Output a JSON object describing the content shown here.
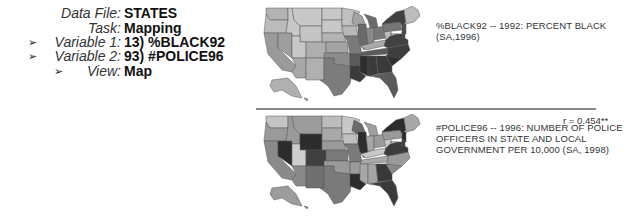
{
  "info_panel": {
    "rows": [
      {
        "label": "Data File:",
        "value": "STATES",
        "arrow": false
      },
      {
        "label": "Task:",
        "value": "Mapping",
        "arrow": false
      },
      {
        "label": "Variable 1:",
        "value": "13) %BLACK92",
        "arrow": true
      },
      {
        "label": "Variable 2:",
        "value": "93) #POLICE96",
        "arrow": true
      },
      {
        "label": "View:",
        "value": "Map",
        "arrow": true
      }
    ],
    "arrow_glyph": "➢"
  },
  "maps": [
    {
      "variable": "%BLACK92",
      "caption_lines": [
        "%BLACK92 -- 1992: PERCENT BLACK",
        "(SA,1996)"
      ],
      "shading": {
        "WA": "#b4b4b4",
        "OR": "#bcbcbc",
        "CA": "#9a9a9a",
        "NV": "#9e9e9e",
        "ID": "#c8c8c8",
        "MT": "#c8c8c8",
        "WY": "#c4c4c4",
        "UT": "#c8c8c8",
        "AZ": "#a8a8a8",
        "CO": "#aeaeae",
        "NM": "#b0b0b0",
        "ND": "#c8c8c8",
        "SD": "#c8c8c8",
        "NE": "#b4b4b4",
        "KS": "#a4a4a4",
        "OK": "#8c8c8c",
        "TX": "#7c7c7c",
        "MN": "#c0c0c0",
        "IA": "#b8b8b8",
        "MO": "#7a7a7a",
        "AR": "#5a5a5a",
        "LA": "#3a3a3a",
        "WI": "#a4a4a4",
        "IL": "#6a6a6a",
        "MI": "#6a6a6a",
        "IN": "#8a8a8a",
        "OH": "#787878",
        "KY": "#a8a8a8",
        "TN": "#5c5c5c",
        "MS": "#2e2e2e",
        "AL": "#3a3a3a",
        "GA": "#3a3a3a",
        "FL": "#5a5a5a",
        "SC": "#303030",
        "NC": "#3e3e3e",
        "VA": "#424242",
        "WV": "#bcbcbc",
        "PA": "#767676",
        "NY": "#404040",
        "NJ": "#505050",
        "DE": "#4a4a4a",
        "MD": "#343434",
        "NE_NEW": "#bdbdbd",
        "AK": "#b0b0b0",
        "HI": "#9a9a9a"
      }
    },
    {
      "variable": "#POLICE96",
      "caption_lines": [
        "#POLICE96 -- 1996: NUMBER OF POLICE",
        "OFFICERS IN STATE AND LOCAL",
        "GOVERNMENT PER 10,000 (SA, 1998)"
      ],
      "correlation": "r = 0.454**",
      "shading": {
        "WA": "#c4c4c4",
        "OR": "#9a9a9a",
        "CA": "#8a8a8a",
        "NV": "#2c2c2c",
        "ID": "#9a9a9a",
        "MT": "#9c9c9c",
        "WY": "#2c2c2c",
        "UT": "#cdcdcd",
        "AZ": "#8a8a8a",
        "CO": "#404040",
        "NM": "#707070",
        "ND": "#bcbcbc",
        "SD": "#a8a8a8",
        "NE": "#9a9a9a",
        "KS": "#7a7a7a",
        "OK": "#9a9a9a",
        "TX": "#7a7a7a",
        "MN": "#c8c8c8",
        "IA": "#c0c0c0",
        "MO": "#7a7a7a",
        "AR": "#9c9c9c",
        "LA": "#2c2c2c",
        "WI": "#6a6a6a",
        "IL": "#2e2e2e",
        "MI": "#a0a0a0",
        "IN": "#a8a8a8",
        "OH": "#9a9a9a",
        "KY": "#c8c8c8",
        "TN": "#a8a8a8",
        "MS": "#a8a8a8",
        "AL": "#a4a4a4",
        "GA": "#383838",
        "FL": "#3a3a3a",
        "SC": "#8a8a8a",
        "NC": "#9a9a9a",
        "VA": "#3c3c3c",
        "WV": "#c8c8c8",
        "PA": "#9a9a9a",
        "NY": "#2c2c2c",
        "NJ": "#2a2a2a",
        "DE": "#404040",
        "MD": "#383838",
        "NE_NEW": "#a8a8a8",
        "AK": "#9c9c9c",
        "HI": "#8a8a8a"
      }
    }
  ]
}
